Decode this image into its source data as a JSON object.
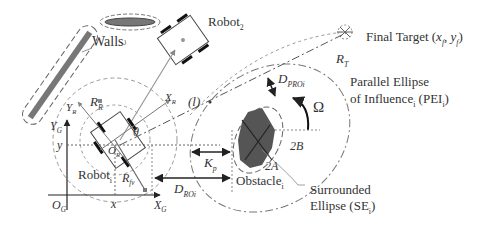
{
  "diagram": {
    "labels": {
      "walls": "Walls",
      "robot2": "Robot",
      "robot2_sub": "2",
      "robot1": "Robot",
      "robot1_sub": "i",
      "final_target": "Final Target (",
      "final_target_x": "x",
      "final_target_xsub": "f",
      "final_target_comma": ", ",
      "final_target_y": "y",
      "final_target_ysub": "f",
      "final_target_close": ")",
      "rt": "R",
      "rt_sub": "T",
      "pei_line1": "Parallel Ellipse",
      "pei_line2": "of Influence",
      "pei_sub": "i",
      "pei_abbr": " (PEI",
      "pei_abbr_sub": "i",
      "pei_close": ")",
      "dproi": "D",
      "dproi_sub": "PROi",
      "omega": "Ω",
      "l_marker": "(l)",
      "rr": "R",
      "rr_sub": "R",
      "yr": "Y",
      "yr_sub": "R",
      "xr": "X",
      "xr_sub": "R",
      "theta": "θ",
      "or": "O",
      "or_sub": "R",
      "yg": "Y",
      "yg_sub": "G",
      "y": "y",
      "x": "x",
      "og": "O",
      "og_sub": "G",
      "xg": "X",
      "xg_sub": "G",
      "rfv": "R",
      "rfv_sub": "fv",
      "kp": "K",
      "kp_sub": "p",
      "droi": "D",
      "droi_sub": "ROi",
      "two_a": "2A",
      "two_b": "2B",
      "obstacle": "Obstacle",
      "obstacle_sub": "i",
      "se_line1": "Surrounded",
      "se_line2": "Ellipse (SE",
      "se_sub": "i",
      "se_close": ")"
    },
    "colors": {
      "line": "#555555",
      "dash": "#888888",
      "obstacle_fill": "#555555",
      "wall_fill": "#777777",
      "text": "#333333"
    }
  }
}
